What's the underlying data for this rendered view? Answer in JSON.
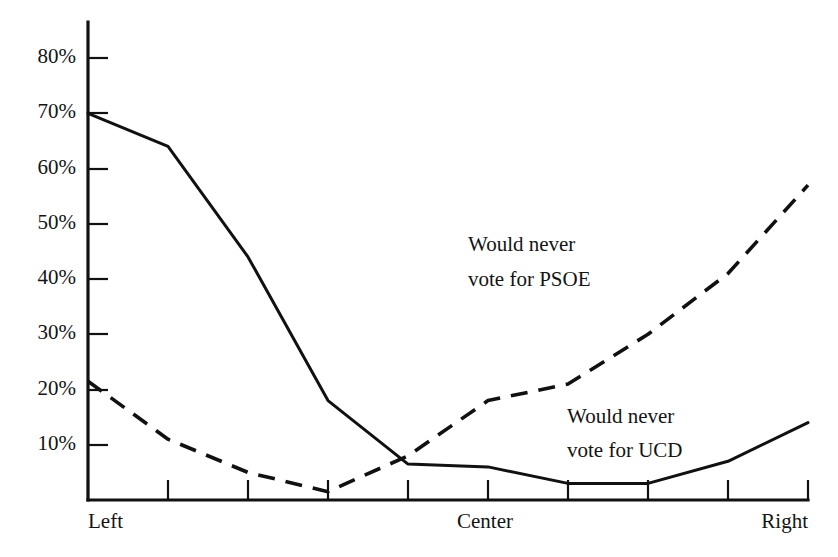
{
  "chart_data": {
    "type": "line",
    "title": "",
    "subtitle": "",
    "xlabel": "",
    "ylabel": "",
    "grid": false,
    "legend_position": "inline-annotation",
    "x": [
      1,
      2,
      3,
      4,
      5,
      6,
      7,
      8,
      9,
      10
    ],
    "x_tick_labels": [
      "Left",
      "",
      "",
      "",
      "",
      "Center",
      "",
      "",
      "",
      "Right"
    ],
    "x_axis_anchor_labels": [
      {
        "label": "Left",
        "x": 1
      },
      {
        "label": "Center",
        "x": 6
      },
      {
        "label": "Right",
        "x": 10
      }
    ],
    "y_tick_labels": [
      "10%",
      "20%",
      "30%",
      "40%",
      "50%",
      "60%",
      "70%",
      "80%"
    ],
    "y_tick_values": [
      10,
      20,
      30,
      40,
      50,
      60,
      70,
      80
    ],
    "ylim": [
      0,
      85
    ],
    "xlim": [
      1,
      10
    ],
    "series": [
      {
        "name": "Would never vote for UCD",
        "style": "solid",
        "color": "#111111",
        "values": [
          70,
          64,
          44,
          18,
          6.5,
          6,
          3,
          3,
          7,
          14
        ],
        "annotation": {
          "line1": "Would never",
          "line2": "vote for UCD"
        }
      },
      {
        "name": "Would never vote for PSOE",
        "style": "dashed",
        "color": "#111111",
        "values": [
          21.5,
          11,
          5,
          1.5,
          8,
          18,
          21,
          30,
          41,
          57
        ],
        "annotation": {
          "line1": "Would never",
          "line2": "vote for PSOE"
        }
      }
    ]
  },
  "annotations": {
    "psoe": {
      "line1": "Would never",
      "line2": "vote for PSOE"
    },
    "ucd": {
      "line1": "Would never",
      "line2": "vote for UCD"
    }
  },
  "axis": {
    "y_labels": [
      "80%",
      "70%",
      "60%",
      "50%",
      "40%",
      "30%",
      "20%",
      "10%"
    ],
    "x_labels": {
      "left": "Left",
      "center": "Center",
      "right": "Right"
    }
  },
  "colors": {
    "ink": "#111111",
    "background": "#ffffff"
  }
}
